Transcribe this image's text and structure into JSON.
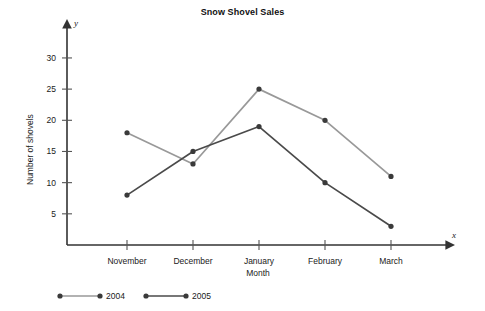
{
  "chart_data": {
    "type": "line",
    "title": "Snow Shovel Sales",
    "xlabel": "Month",
    "ylabel": "Number of shovels",
    "x_axis_variable": "x",
    "y_axis_variable": "y",
    "categories": [
      "November",
      "December",
      "January",
      "February",
      "March"
    ],
    "yticks": [
      5,
      10,
      15,
      20,
      25,
      30
    ],
    "ylim": [
      0,
      34
    ],
    "grid": false,
    "legend_position": "bottom-left",
    "series": [
      {
        "name": "2004",
        "color": "#999999",
        "values": [
          18,
          13,
          25,
          20,
          11
        ]
      },
      {
        "name": "2005",
        "color": "#4a4a4a",
        "values": [
          8,
          15,
          19,
          10,
          3
        ]
      }
    ]
  }
}
